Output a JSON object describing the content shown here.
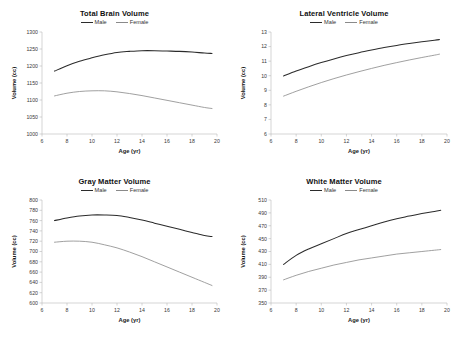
{
  "figure": {
    "background": "#ffffff",
    "male_color": "#2b2b2b",
    "female_color": "#8f8f8f",
    "axis_color": "#b8b8b8"
  },
  "common": {
    "xlabel": "Age (yr)",
    "ylabel": "Volume (cc)",
    "legend": [
      "Male",
      "Female"
    ],
    "xticks": [
      6,
      8,
      10,
      12,
      14,
      16,
      18,
      20
    ],
    "xlim": [
      6,
      20
    ]
  },
  "chart_data": [
    {
      "type": "line",
      "title": "Total Brain Volume",
      "xlabel": "Age (yr)",
      "ylabel": "Volume (cc)",
      "xlim": [
        6,
        20
      ],
      "ylim": [
        1000,
        1300
      ],
      "xticks": [
        6,
        8,
        10,
        12,
        14,
        16,
        18,
        20
      ],
      "yticks": [
        1000,
        1050,
        1100,
        1150,
        1200,
        1250,
        1300
      ],
      "grid": false,
      "legend_position": "top-center",
      "x": [
        7.0,
        8.0,
        9.0,
        10.0,
        11.0,
        12.0,
        13.0,
        14.0,
        15.0,
        16.0,
        17.0,
        18.0,
        19.0,
        19.6
      ],
      "series": [
        {
          "name": "Male",
          "color": "#2b2b2b",
          "values": [
            1185,
            1201,
            1214,
            1224,
            1233,
            1240,
            1243,
            1245,
            1245,
            1244,
            1243,
            1241,
            1238,
            1237
          ]
        },
        {
          "name": "Female",
          "color": "#8f8f8f",
          "values": [
            1112,
            1120,
            1125,
            1127,
            1127,
            1124,
            1119,
            1113,
            1106,
            1099,
            1092,
            1085,
            1078,
            1075
          ]
        }
      ]
    },
    {
      "type": "line",
      "title": "Lateral Ventricle Volume",
      "xlabel": "Age (yr)",
      "ylabel": "Volume (cc)",
      "xlim": [
        6,
        20
      ],
      "ylim": [
        6,
        13
      ],
      "xticks": [
        6,
        8,
        10,
        12,
        14,
        16,
        18,
        20
      ],
      "yticks": [
        6,
        7,
        8,
        9,
        10,
        11,
        12,
        13
      ],
      "grid": false,
      "legend_position": "top-center",
      "x": [
        7.0,
        8.0,
        9.0,
        10.0,
        11.0,
        12.0,
        13.0,
        14.0,
        15.0,
        16.0,
        17.0,
        18.0,
        19.0,
        19.4
      ],
      "series": [
        {
          "name": "Male",
          "color": "#2b2b2b",
          "values": [
            9.98,
            10.32,
            10.62,
            10.9,
            11.15,
            11.38,
            11.58,
            11.76,
            11.93,
            12.08,
            12.21,
            12.33,
            12.44,
            12.48
          ]
        },
        {
          "name": "Female",
          "color": "#8f8f8f",
          "values": [
            8.6,
            8.93,
            9.24,
            9.53,
            9.8,
            10.05,
            10.28,
            10.5,
            10.71,
            10.9,
            11.08,
            11.25,
            11.41,
            11.48
          ]
        }
      ]
    },
    {
      "type": "line",
      "title": "Gray Matter Volume",
      "xlabel": "Age (yr)",
      "ylabel": "Volume (cc)",
      "xlim": [
        6,
        20
      ],
      "ylim": [
        600,
        800
      ],
      "xticks": [
        6,
        8,
        10,
        12,
        14,
        16,
        18,
        20
      ],
      "yticks": [
        600,
        620,
        640,
        660,
        680,
        700,
        720,
        740,
        760,
        780,
        800
      ],
      "grid": false,
      "legend_position": "top-center",
      "x": [
        7.0,
        8.0,
        9.0,
        10.0,
        11.0,
        12.0,
        13.0,
        14.0,
        15.0,
        16.0,
        17.0,
        18.0,
        19.0,
        19.6
      ],
      "series": [
        {
          "name": "Male",
          "color": "#2b2b2b",
          "values": [
            760,
            765,
            769,
            771,
            771,
            770,
            766,
            761,
            755,
            749,
            743,
            737,
            731,
            729
          ]
        },
        {
          "name": "Female",
          "color": "#8f8f8f",
          "values": [
            718,
            720,
            720,
            718,
            713,
            707,
            699,
            690,
            680,
            670,
            660,
            650,
            640,
            634
          ]
        }
      ]
    },
    {
      "type": "line",
      "title": "White Matter Volume",
      "xlabel": "Age (yr)",
      "ylabel": "Volume (cc)",
      "xlim": [
        6,
        20
      ],
      "ylim": [
        350,
        510
      ],
      "xticks": [
        6,
        8,
        10,
        12,
        14,
        16,
        18,
        20
      ],
      "yticks": [
        350,
        370,
        390,
        410,
        430,
        450,
        470,
        490,
        510
      ],
      "grid": false,
      "legend_position": "top-center",
      "x": [
        7.0,
        8.0,
        9.0,
        10.0,
        11.0,
        12.0,
        13.0,
        14.0,
        15.0,
        16.0,
        17.0,
        18.0,
        19.0,
        19.5
      ],
      "series": [
        {
          "name": "Male",
          "color": "#2b2b2b",
          "values": [
            410,
            424,
            434,
            442,
            450,
            458,
            464,
            470,
            476,
            481,
            485,
            489,
            492,
            494
          ]
        },
        {
          "name": "Female",
          "color": "#8f8f8f",
          "values": [
            386,
            393,
            399,
            404,
            409,
            413,
            417,
            420,
            423,
            426,
            428,
            430,
            432,
            433
          ]
        }
      ]
    }
  ],
  "panels": [
    {
      "title": "Total Brain Volume",
      "xlabel": "Age (yr)",
      "ylabel": "Volume (cc)",
      "male": "Male",
      "female": "Female"
    },
    {
      "title": "Lateral Ventricle Volume",
      "xlabel": "Age (yr)",
      "ylabel": "Volume (cc)",
      "male": "Male",
      "female": "Female"
    },
    {
      "title": "Gray Matter Volume",
      "xlabel": "Age (yr)",
      "ylabel": "Volume (cc)",
      "male": "Male",
      "female": "Female"
    },
    {
      "title": "White Matter Volume",
      "xlabel": "Age (yr)",
      "ylabel": "Volume (cc)",
      "male": "Male",
      "female": "Female"
    }
  ]
}
